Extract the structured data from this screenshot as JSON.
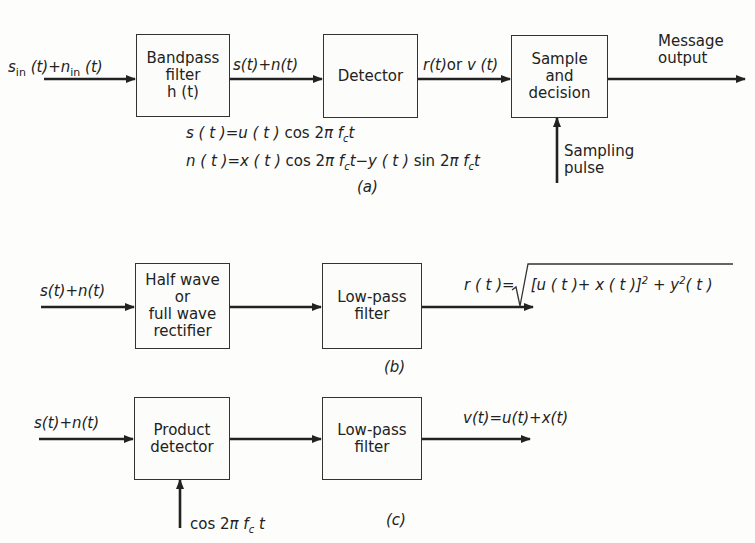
{
  "figure": {
    "panels": [
      {
        "id": "a",
        "caption": "(a)",
        "input_label": "s_in(t)+n_in(t)",
        "blocks": [
          {
            "label": "Bandpass\nfilter\nh (t)"
          },
          {
            "label": "Detector"
          },
          {
            "label": "Sample\nand\ndecision"
          }
        ],
        "edge_labels": [
          "s(t)+n(t)",
          "r(t)or v(t)"
        ],
        "output_label": "Message\noutput",
        "side_input_label": "Sampling\npulse",
        "equations": [
          "s(t)=u(t) cos 2πf_c t",
          "n(t)=x(t) cos 2πf_c t−y(t) sin 2πf_c t"
        ]
      },
      {
        "id": "b",
        "caption": "(b)",
        "input_label": "s(t)+n(t)",
        "blocks": [
          {
            "label": "Half wave\nor\nfull wave\nrectifier"
          },
          {
            "label": "Low-pass\nfilter"
          }
        ],
        "output_label": "r(t)=√([u(t)+x(t)]² + y²(t))"
      },
      {
        "id": "c",
        "caption": "(c)",
        "input_label": "s(t)+n(t)",
        "blocks": [
          {
            "label": "Product\ndetector"
          },
          {
            "label": "Low-pass\nfilter"
          }
        ],
        "side_input_label": "cos 2π f_c t",
        "output_label": "v(t)=u(t)+x(t)"
      }
    ]
  },
  "text": {
    "a_in_s": "s",
    "a_in_sub1": "in",
    "a_in_mid": " (t)+",
    "a_in_n": "n",
    "a_in_sub2": "in",
    "a_in_end": " (t)",
    "a_edge1": "s(t)+n(t)",
    "a_edge2_r": "r(t)",
    "a_edge2_or": "or",
    "a_edge2_v": "v (t)",
    "a_eq1_lhs": "s ( t )=u ( t ) ",
    "a_eq1_cos": "cos 2",
    "a_eq1_pi": "π f",
    "a_eq1_c": "c",
    "a_eq1_t": "t",
    "a_eq2_lhs": "n ( t )=x ( t ) ",
    "a_eq2_cos": "cos 2",
    "a_eq2_pi": "π f",
    "a_eq2_c": "c",
    "a_eq2_mid": "t−y ( t ) ",
    "a_eq2_sin": "sin 2",
    "a_eq2_pi2": "π f",
    "a_eq2_c2": "c",
    "a_eq2_t": "t",
    "b_out_lhs": "r ( t )=",
    "b_out_inner": "[u ( t )+ x ( t )]",
    "b_out_sq": "2",
    "b_out_plus": " + y",
    "b_out_sq2": "2",
    "b_out_end": "( t )",
    "c_side_cos": "cos 2",
    "c_side_pi": "π f",
    "c_side_c": "c",
    "c_side_t": " t"
  }
}
